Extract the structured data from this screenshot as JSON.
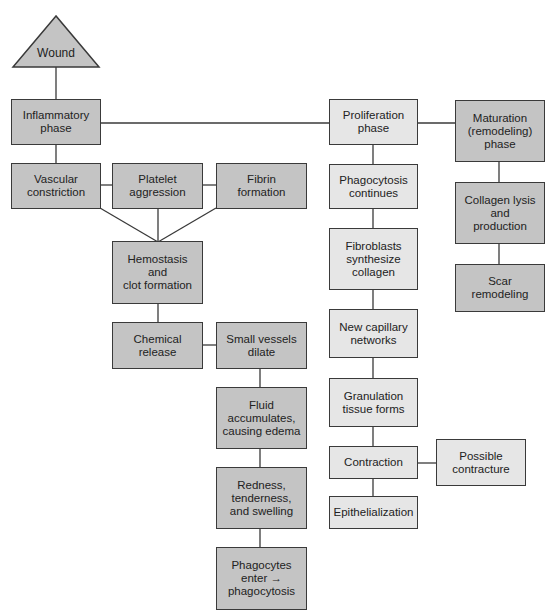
{
  "diagram": {
    "type": "flowchart",
    "title": "",
    "colors": {
      "dark_box": "#c4c4c4",
      "light_box": "#e6e6e6",
      "line": "#3a3a3a"
    },
    "nodes": {
      "wound": "Wound",
      "inflammatory": "Inflammatory\nphase",
      "vascular": "Vascular\nconstriction",
      "platelet": "Platelet\naggression",
      "fibrin": "Fibrin\nformation",
      "hemostasis": "Hemostasis\nand\nclot formation",
      "chemical": "Chemical\nrelease",
      "small_vessels": "Small vessels\ndilate",
      "fluid": "Fluid\naccumulates,\ncausing edema",
      "redness": "Redness,\ntenderness,\nand swelling",
      "phagocytes": "Phagocytes\nenter →\nphagocytosis",
      "proliferation": "Proliferation\nphase",
      "phagocytosis_continues": "Phagocytosis\ncontinues",
      "fibroblasts": "Fibroblasts\nsynthesize\ncollagen",
      "capillary": "New capillary\nnetworks",
      "granulation": "Granulation\ntissue forms",
      "contraction": "Contraction",
      "contracture": "Possible\ncontracture",
      "epithelialization": "Epithelialization",
      "maturation": "Maturation\n(remodeling)\nphase",
      "collagen_lysis": "Collagen lysis\nand\nproduction",
      "scar": "Scar\nremodeling"
    },
    "edges": [
      [
        "wound",
        "inflammatory"
      ],
      [
        "inflammatory",
        "proliferation"
      ],
      [
        "proliferation",
        "maturation"
      ],
      [
        "inflammatory",
        "vascular"
      ],
      [
        "vascular",
        "platelet"
      ],
      [
        "platelet",
        "fibrin"
      ],
      [
        "vascular",
        "hemostasis"
      ],
      [
        "platelet",
        "hemostasis"
      ],
      [
        "fibrin",
        "hemostasis"
      ],
      [
        "hemostasis",
        "chemical"
      ],
      [
        "chemical",
        "small_vessels"
      ],
      [
        "small_vessels",
        "fluid"
      ],
      [
        "fluid",
        "redness"
      ],
      [
        "redness",
        "phagocytes"
      ],
      [
        "proliferation",
        "phagocytosis_continues"
      ],
      [
        "phagocytosis_continues",
        "fibroblasts"
      ],
      [
        "fibroblasts",
        "capillary"
      ],
      [
        "capillary",
        "granulation"
      ],
      [
        "granulation",
        "contraction"
      ],
      [
        "contraction",
        "contracture"
      ],
      [
        "contraction",
        "epithelialization"
      ],
      [
        "maturation",
        "collagen_lysis"
      ],
      [
        "collagen_lysis",
        "scar"
      ]
    ]
  }
}
